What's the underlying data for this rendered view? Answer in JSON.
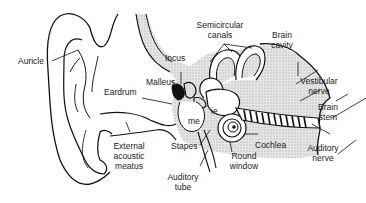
{
  "labels": {
    "auricle": "Auricle",
    "eardrum": "Eardrum",
    "incus": "Incus",
    "malleus": "Malleus",
    "semicircular_canals_1": "Semicircular",
    "semicircular_canals_2": "canals",
    "brain_cavity_1": "Brain",
    "brain_cavity_2": "cavity",
    "vestibular_nerve_1": "Vestibular",
    "vestibular_nerve_2": "nerve",
    "brain_stem_1": "Brain",
    "brain_stem_2": "stem",
    "inner_ear": "ie",
    "middle_ear": "me",
    "external_meatus_1": "External",
    "external_meatus_2": "acoustic",
    "external_meatus_3": "meatus",
    "stapes": "Stapes",
    "cochlea": "Cochlea",
    "round_window_1": "Round",
    "round_window_2": "window",
    "auditory_nerve_1": "Auditory",
    "auditory_nerve_2": "nerve",
    "auditory_tube_1": "Auditory",
    "auditory_tube_2": "tube"
  },
  "colors": {
    "line": "#111111",
    "shade": "#d8d8d8",
    "background": "#ffffff"
  }
}
